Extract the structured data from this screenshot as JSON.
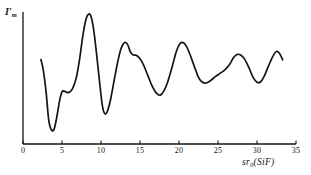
{
  "figure": {
    "background_color": "#ffffff",
    "line_color": "#141414",
    "axis_color": "#141414"
  },
  "axes": {
    "y_title_main": "I",
    "y_title_prime": "′",
    "y_title_sub": "m",
    "x_title_main": "sr",
    "x_title_sub": "0",
    "x_title_tail": "(SiF)"
  },
  "chart_data": {
    "type": "line",
    "title": "",
    "xlabel": "sr₀(SiF)",
    "ylabel": "I′ₘ",
    "xlim": [
      0,
      35
    ],
    "ylim": [
      0,
      1
    ],
    "grid": false,
    "legend": null,
    "xticks": [
      0,
      5,
      10,
      15,
      20,
      25,
      30,
      35
    ],
    "xticklabels": [
      "0",
      "5",
      "10",
      "15",
      "20",
      "25",
      "30",
      "35"
    ],
    "yticks": [],
    "yticklabels": [],
    "series": [
      {
        "name": "modified molecular intensity",
        "x": [
          2.3,
          2.6,
          2.95,
          3.3,
          3.65,
          4.0,
          4.35,
          4.7,
          5.0,
          5.3,
          5.6,
          5.95,
          6.35,
          6.8,
          7.25,
          7.7,
          8.1,
          8.45,
          8.75,
          9.05,
          9.4,
          9.8,
          10.15,
          10.45,
          10.8,
          11.2,
          11.65,
          12.1,
          12.55,
          13.0,
          13.4,
          13.75,
          14.1,
          14.5,
          14.95,
          15.45,
          16.0,
          16.55,
          17.1,
          17.6,
          18.05,
          18.55,
          19.1,
          19.6,
          20.05,
          20.45,
          20.9,
          21.4,
          21.95,
          22.5,
          23.0,
          23.5,
          24.05,
          24.65,
          25.25,
          25.85,
          26.45,
          27.0,
          27.45,
          27.9,
          28.4,
          28.95,
          29.5,
          30.0,
          30.45,
          30.9,
          31.4,
          31.95,
          32.45,
          32.85,
          33.3
        ],
        "y": [
          0.64,
          0.56,
          0.4,
          0.18,
          0.105,
          0.115,
          0.21,
          0.33,
          0.395,
          0.4,
          0.392,
          0.392,
          0.42,
          0.495,
          0.64,
          0.83,
          0.95,
          0.985,
          0.96,
          0.87,
          0.7,
          0.48,
          0.3,
          0.232,
          0.245,
          0.33,
          0.47,
          0.61,
          0.72,
          0.768,
          0.755,
          0.7,
          0.675,
          0.672,
          0.65,
          0.6,
          0.52,
          0.44,
          0.385,
          0.37,
          0.4,
          0.47,
          0.58,
          0.69,
          0.755,
          0.77,
          0.745,
          0.68,
          0.59,
          0.505,
          0.468,
          0.462,
          0.48,
          0.51,
          0.535,
          0.56,
          0.6,
          0.655,
          0.678,
          0.675,
          0.645,
          0.58,
          0.505,
          0.468,
          0.47,
          0.51,
          0.58,
          0.655,
          0.7,
          0.69,
          0.638
        ]
      }
    ]
  },
  "tick_positions_px": {
    "x0_px": 23,
    "x35_px": 296,
    "baseline_px": 144,
    "top_px": 12
  }
}
